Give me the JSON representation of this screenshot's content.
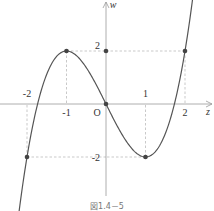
{
  "chart_data": {
    "type": "line",
    "title": "",
    "function": "w = z^3 - 3z",
    "xlabel": "z",
    "ylabel": "w",
    "origin_label": "O",
    "x_ticks": [
      {
        "value": -2,
        "label": "-2"
      },
      {
        "value": -1,
        "label": "-1"
      },
      {
        "value": 1,
        "label": "1"
      },
      {
        "value": 2,
        "label": "2"
      }
    ],
    "y_ticks": [
      {
        "value": 2,
        "label": "2"
      },
      {
        "value": -2,
        "label": "-2"
      }
    ],
    "marked_points": [
      {
        "x": -2,
        "y": -2
      },
      {
        "x": -1,
        "y": 2
      },
      {
        "x": 0,
        "y": 0
      },
      {
        "x": 0,
        "y": 2
      },
      {
        "x": 1,
        "y": -2
      },
      {
        "x": 2,
        "y": 2
      }
    ],
    "xlim": [
      -2.7,
      2.9
    ],
    "ylim": [
      -3.0,
      3.8
    ],
    "grid": false,
    "guide_lines": "dashed lines from extrema to axes",
    "caption": "図1.4－5"
  },
  "colors": {
    "curve": "#555555",
    "axis": "#999999",
    "dashed": "#bbbbbb",
    "point": "#444444"
  }
}
